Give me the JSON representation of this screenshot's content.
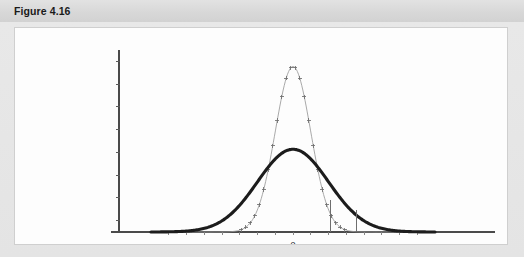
{
  "figure": {
    "header_label": "Figure 4.16",
    "panel_background": "#fdfdfd",
    "header_background": "#dcdcdc",
    "body_background": "#e6e6e6"
  },
  "chart_data": {
    "type": "line",
    "title": "",
    "subtitle": "",
    "xlabel": "",
    "ylabel": "",
    "grid": false,
    "legend": "none",
    "x_tick_labels": [
      "0"
    ],
    "x_tick_label_positions": [
      0
    ],
    "y_tick_labels": [],
    "y_tick_count": 8,
    "xlim": [
      -4.0,
      4.0
    ],
    "ylim": [
      0,
      0.88
    ],
    "annotations": [
      {
        "name": "reference-line-1",
        "type": "vline",
        "x": 1.05,
        "y_top": 0.155,
        "color": "#6e6e6e"
      },
      {
        "name": "reference-line-2",
        "type": "vline",
        "x": 1.78,
        "y_top": 0.105,
        "color": "#6e6e6e"
      }
    ],
    "series": [
      {
        "name": "narrow-normal-curve",
        "style": "line-with-plus-markers",
        "color": "#9a9a9a",
        "mean": 0,
        "sigma": 0.5,
        "peak": 0.8,
        "marker": "plus",
        "marker_count": 41
      },
      {
        "name": "wide-normal-curve",
        "style": "thick-line",
        "color": "#1c1c1c",
        "mean": 0,
        "sigma": 1.0,
        "peak": 0.4,
        "marker": "none"
      }
    ]
  }
}
